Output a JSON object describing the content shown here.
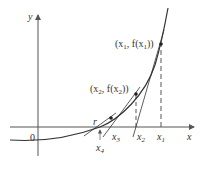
{
  "diagram": {
    "axes": {
      "x_label": "x",
      "y_label": "y",
      "origin_label": "0"
    },
    "points": [
      {
        "label_base": "(x",
        "label_sub": "1",
        "label_mid": ", f(x",
        "label_sub2": "1",
        "label_end": "))"
      },
      {
        "label_base": "(x",
        "label_sub": "2",
        "label_mid": ", f(x",
        "label_sub2": "2",
        "label_end": "))"
      }
    ],
    "x_ticks": [
      {
        "base": "x",
        "sub": "1"
      },
      {
        "base": "x",
        "sub": "2"
      },
      {
        "base": "x",
        "sub": "3"
      },
      {
        "base": "x",
        "sub": "4"
      }
    ],
    "root_label": "r",
    "colors": {
      "curve": "#333333",
      "axis": "#555555",
      "dashed": "#555555"
    }
  }
}
